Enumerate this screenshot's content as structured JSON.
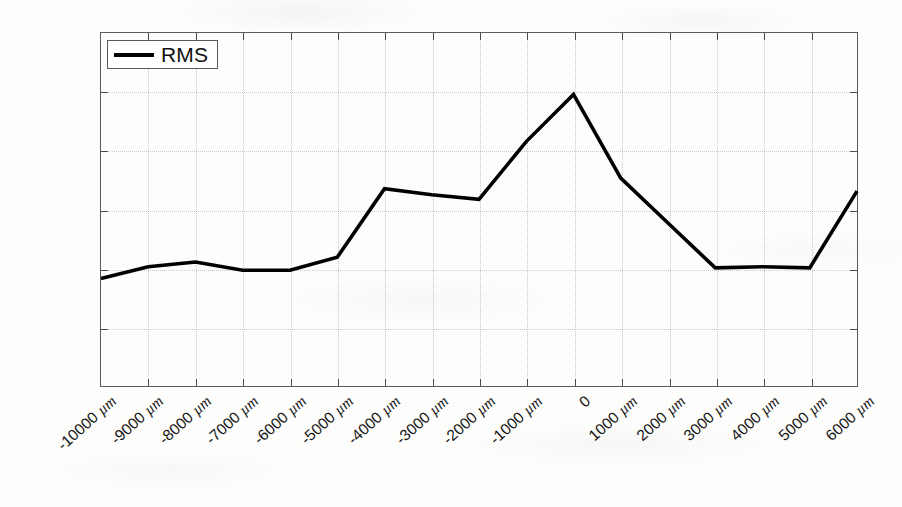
{
  "chart_data": {
    "type": "line",
    "title": "",
    "xlabel": "",
    "ylabel": "",
    "grid": true,
    "legend_position": "top-left",
    "ylim": [
      0,
      3
    ],
    "ytick_values": [
      0,
      0.5,
      1,
      1.5,
      2,
      2.5,
      3
    ],
    "ytick_labels": [
      "0",
      "0.5",
      "1",
      "1.5",
      "2",
      "2.5",
      "3"
    ],
    "categories": [
      "-10000 µm",
      "-9000 µm",
      "-8000 µm",
      "-7000 µm",
      "-6000 µm",
      "-5000 µm",
      "-4000 µm",
      "-3000 µm",
      "-2000 µm",
      "-1000 µm",
      "0",
      "1000 µm",
      "2000 µm",
      "3000 µm",
      "4000 µm",
      "5000 µm",
      "6000 µm"
    ],
    "x_values": [
      -10000,
      -9000,
      -8000,
      -7000,
      -6000,
      -5000,
      -4000,
      -3000,
      -2000,
      -1000,
      0,
      1000,
      2000,
      3000,
      4000,
      5000,
      6000
    ],
    "series": [
      {
        "name": "RMS",
        "color": "#000000",
        "values": [
          0.92,
          1.02,
          1.06,
          0.99,
          0.99,
          1.1,
          1.68,
          1.63,
          1.59,
          2.08,
          2.48,
          1.77,
          1.39,
          1.01,
          1.02,
          1.01,
          1.66
        ]
      }
    ]
  },
  "legend": {
    "entries": [
      {
        "label": "RMS"
      }
    ]
  }
}
